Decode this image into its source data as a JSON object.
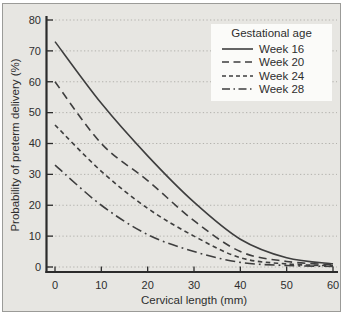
{
  "colors": {
    "panel_bg": "#e7e6e2",
    "frame_border": "#9b9b98",
    "axis": "#2b2b2b",
    "grid": "#b3b2ad",
    "curve": "#3e3e3e",
    "legend_bg": "#fbfbf9",
    "text": "#2e2e2e"
  },
  "chart_data": {
    "type": "line",
    "title": "",
    "xlabel": "Cervical length (mm)",
    "ylabel": "Probability of preterm delivery (%)",
    "xlim": [
      0,
      60
    ],
    "ylim": [
      0,
      80
    ],
    "x_ticks": [
      0,
      10,
      20,
      30,
      40,
      50,
      60
    ],
    "y_ticks": [
      0,
      10,
      20,
      30,
      40,
      50,
      60,
      70,
      80
    ],
    "grid": "horizontal dotted gridlines at every y tick",
    "legend": {
      "title": "Gestational age",
      "position": "top-right"
    },
    "x": [
      0,
      10,
      20,
      30,
      40,
      50,
      60
    ],
    "series": [
      {
        "name": "Week 16",
        "style": "solid",
        "values": [
          73,
          53,
          36,
          21,
          9,
          3,
          1
        ]
      },
      {
        "name": "Week 20",
        "style": "long-dash",
        "values": [
          60,
          40,
          28,
          15,
          5,
          1.8,
          0.7
        ]
      },
      {
        "name": "Week 24",
        "style": "short-dash",
        "values": [
          46,
          31,
          19,
          10,
          3,
          1,
          0.4
        ]
      },
      {
        "name": "Week 28",
        "style": "dash-dot",
        "values": [
          33,
          20,
          10.5,
          5,
          1.5,
          0.5,
          0.2
        ]
      }
    ]
  }
}
